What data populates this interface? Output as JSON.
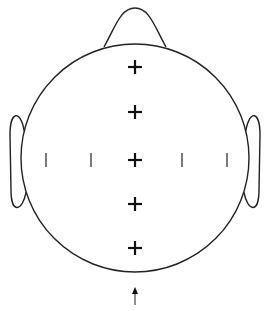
{
  "diagram": {
    "type": "eeg-head-top-view",
    "colors": {
      "line": "#222222",
      "background": "#ffffff"
    },
    "head": {
      "cx": 135,
      "cy": 158,
      "r": 114
    },
    "nose": {
      "apex": [
        135,
        8
      ],
      "base_left": [
        104,
        47
      ],
      "base_right": [
        166,
        47
      ]
    },
    "ears": [
      {
        "side": "left",
        "x_outer": 10,
        "y_top": 115,
        "y_bottom": 208
      },
      {
        "side": "right",
        "x_outer": 260,
        "y_top": 115,
        "y_bottom": 208
      }
    ],
    "midline_crosses": [
      {
        "x": 135,
        "y": 67
      },
      {
        "x": 135,
        "y": 112
      },
      {
        "x": 135,
        "y": 160
      },
      {
        "x": 135,
        "y": 204
      },
      {
        "x": 135,
        "y": 248
      }
    ],
    "lateral_ticks": [
      {
        "x": 46,
        "y": 160
      },
      {
        "x": 91,
        "y": 160
      },
      {
        "x": 182,
        "y": 160
      },
      {
        "x": 227,
        "y": 160
      }
    ],
    "arrow": {
      "x": 135,
      "y_tail": 305,
      "y_head": 287,
      "direction": "up"
    }
  }
}
